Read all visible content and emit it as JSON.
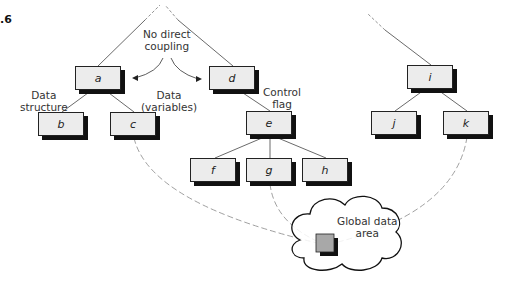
{
  "figure": {
    "number_fragment": ".6"
  },
  "annotations": {
    "no_direct_coupling": [
      "No direct",
      "coupling"
    ],
    "data_structure": [
      "Data",
      "structure"
    ],
    "data_variables": [
      "Data",
      "(variables)"
    ],
    "control_flag": [
      "Control",
      "flag"
    ],
    "global_data_area": [
      "Global data",
      "area"
    ]
  },
  "modules": [
    {
      "id": "a",
      "label": "a"
    },
    {
      "id": "b",
      "label": "b"
    },
    {
      "id": "c",
      "label": "c"
    },
    {
      "id": "d",
      "label": "d"
    },
    {
      "id": "e",
      "label": "e"
    },
    {
      "id": "f",
      "label": "f"
    },
    {
      "id": "g",
      "label": "g"
    },
    {
      "id": "h",
      "label": "h"
    },
    {
      "id": "i",
      "label": "i"
    },
    {
      "id": "j",
      "label": "j"
    },
    {
      "id": "k",
      "label": "k"
    }
  ],
  "edges": [
    {
      "from": "a",
      "to": "b"
    },
    {
      "from": "a",
      "to": "c"
    },
    {
      "from": "d",
      "to": "e"
    },
    {
      "from": "e",
      "to": "f"
    },
    {
      "from": "e",
      "to": "g"
    },
    {
      "from": "e",
      "to": "h"
    },
    {
      "from": "i",
      "to": "j"
    },
    {
      "from": "i",
      "to": "k"
    }
  ],
  "global_links": [
    "c",
    "g",
    "k"
  ],
  "colors": {
    "box_fill": "#ececec",
    "shadow": "#111111",
    "global_square": "#a8a8a8"
  }
}
